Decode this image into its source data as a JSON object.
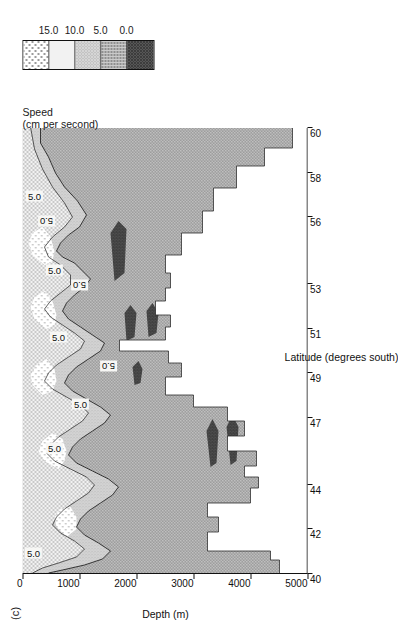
{
  "figure": {
    "panel_label": "(c)"
  },
  "axes": {
    "x": {
      "title": "Latitude (degrees south)",
      "ticks": [
        40,
        42,
        44,
        47,
        49,
        51,
        53,
        56,
        58,
        60
      ],
      "min": 40,
      "max": 60
    },
    "y": {
      "title": "Depth (m)",
      "ticks": [
        0,
        1000,
        2000,
        3000,
        4000,
        5000
      ],
      "min": 0,
      "max": 5000,
      "inverted": true
    }
  },
  "legend": {
    "title_line1": "Speed",
    "title_line2": "(cm per second)",
    "labels": [
      "15.0",
      "10.0",
      "5.0",
      "0.0"
    ],
    "swatch_fills": [
      "sparse-dots",
      "fine-stipple",
      "light-gray",
      "cross-hatch",
      "dark-dense"
    ]
  },
  "contour_labels": [
    {
      "text": "5.0",
      "x": 40.9,
      "y": 190,
      "dir": "up"
    },
    {
      "text": "5.0",
      "x": 45.6,
      "y": 560,
      "dir": "up"
    },
    {
      "text": "5.0",
      "x": 47.6,
      "y": 1020,
      "dir": "up"
    },
    {
      "text": "5.0",
      "x": 49.3,
      "y": 1500,
      "dir": "down"
    },
    {
      "text": "5.0",
      "x": 50.6,
      "y": 640,
      "dir": "up"
    },
    {
      "text": "5.0",
      "x": 52.9,
      "y": 1000,
      "dir": "down"
    },
    {
      "text": "5.0",
      "x": 53.6,
      "y": 560,
      "dir": "up"
    },
    {
      "text": "5.0",
      "x": 55.8,
      "y": 420,
      "dir": "down"
    },
    {
      "text": "5.0",
      "x": 56.9,
      "y": 210,
      "dir": "up"
    }
  ],
  "chart_data": {
    "type": "area",
    "title": "",
    "xlabel": "Latitude (degrees south)",
    "ylabel": "Depth (m)",
    "xlim": [
      40,
      60
    ],
    "ylim": [
      5000,
      0
    ],
    "grid": false,
    "legend_position": "right",
    "legend_title": "Speed (cm per second)",
    "contour_levels": [
      0.0,
      5.0,
      10.0,
      15.0
    ],
    "fill_bands": [
      {
        "name": "> 15.0",
        "pattern": "sparse-dots",
        "color": "#fbfbfb"
      },
      {
        "name": "10.0 - 15.0",
        "pattern": "fine-stipple",
        "color": "#e8e8e8"
      },
      {
        "name": "5.0 - 10.0",
        "pattern": "light-gray",
        "color": "#cfcfcf"
      },
      {
        "name": "0.0 - 5.0",
        "pattern": "cross-hatch",
        "color": "#9a9a9a"
      },
      {
        "name": "< 0.0",
        "pattern": "dark-dense",
        "color": "#3a3a3a"
      }
    ],
    "bathymetry": {
      "comment": "seafloor depth (m) sampled along latitude (degrees south)",
      "x": [
        40.0,
        40.6,
        41.0,
        41.0,
        42.0,
        42.0,
        43.0,
        43.0,
        44.3,
        44.3,
        45.4,
        45.4,
        46.3,
        46.3,
        47.6,
        47.6,
        48.6,
        48.6,
        48.9,
        48.9,
        49.4,
        49.4,
        50.1,
        50.1,
        50.5,
        50.5,
        50.9,
        50.9,
        51.6,
        51.6,
        52.2,
        52.2,
        52.6,
        52.6,
        53.1,
        53.1,
        53.6,
        53.6,
        54.2,
        54.2,
        54.9,
        54.9,
        55.4,
        55.4,
        56.0,
        56.0,
        56.6,
        56.6,
        57.3,
        57.3,
        58.2,
        58.2,
        59.0,
        59.0,
        60.0
      ],
      "depth": [
        4500,
        4500,
        4350,
        3450,
        3450,
        3250,
        3250,
        4000,
        4000,
        4150,
        4150,
        3950,
        3950,
        4100,
        4100,
        3600,
        3600,
        3900,
        3900,
        3000,
        3000,
        2850,
        2850,
        2500,
        2500,
        2700,
        2700,
        1700,
        1700,
        2550,
        2550,
        2350,
        2350,
        2600,
        2600,
        2500,
        2500,
        2300,
        2300,
        2550,
        2550,
        2500,
        2500,
        2800,
        2800,
        3150,
        3150,
        3350,
        3350,
        3750,
        3750,
        4250,
        4250,
        4750,
        4750
      ]
    },
    "speed_cores": [
      {
        "label": "5.0 contour core near 41S",
        "latitude": 40.9,
        "depth_top": 0,
        "depth_bottom": 420,
        "max_speed": 10
      },
      {
        "label": "jet near 44-46S",
        "latitude": 45.0,
        "depth_top": 0,
        "depth_bottom": 1400,
        "max_speed": 15
      },
      {
        "label": "jet near 47-48S",
        "latitude": 47.5,
        "depth_top": 0,
        "depth_bottom": 1500,
        "max_speed": 15
      },
      {
        "label": "jet near 50S",
        "latitude": 50.2,
        "depth_top": 0,
        "depth_bottom": 1600,
        "max_speed": 15
      },
      {
        "label": "jet near 53S",
        "latitude": 53.0,
        "depth_top": 0,
        "depth_bottom": 1300,
        "max_speed": 15
      },
      {
        "label": "jet near 56-57S",
        "latitude": 56.5,
        "depth_top": 0,
        "depth_bottom": 900,
        "max_speed": 10
      }
    ]
  }
}
